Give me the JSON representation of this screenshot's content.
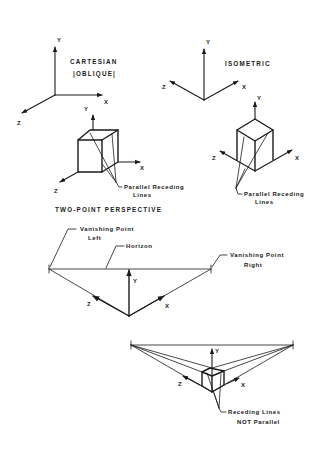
{
  "diagram": {
    "cartesian": {
      "title_line1": "CARTESIAN",
      "title_line2": "|OBLIQUE|",
      "axes": {
        "y": "Y",
        "x": "X",
        "z": "Z"
      },
      "cube_axes": {
        "y": "Y",
        "x": "X",
        "z": "Z"
      },
      "callout_line1": "Parallel Receding",
      "callout_line2": "Lines"
    },
    "isometric": {
      "title": "ISOMETRIC",
      "axes": {
        "y": "Y",
        "x": "X",
        "z": "Z"
      },
      "cube_axes": {
        "y": "Y",
        "x": "X",
        "z": "Z"
      },
      "callout_line1": "Parallel Receding",
      "callout_line2": "Lines"
    },
    "two_point": {
      "title": "TWO-POINT PERSPECTIVE",
      "vp_left_line1": "Vanishing Point",
      "vp_left_line2": "Left",
      "horizon": "Horizon",
      "vp_right_line1": "Vanishing Point",
      "vp_right_line2": "Right",
      "axes": {
        "y": "Y",
        "x": "X",
        "z": "Z"
      }
    },
    "perspective_cube": {
      "axes": {
        "y": "Y",
        "x": "X",
        "z": "Z"
      },
      "callout_line1": "Receding Lines",
      "callout_line2": "NOT Parallel"
    }
  }
}
